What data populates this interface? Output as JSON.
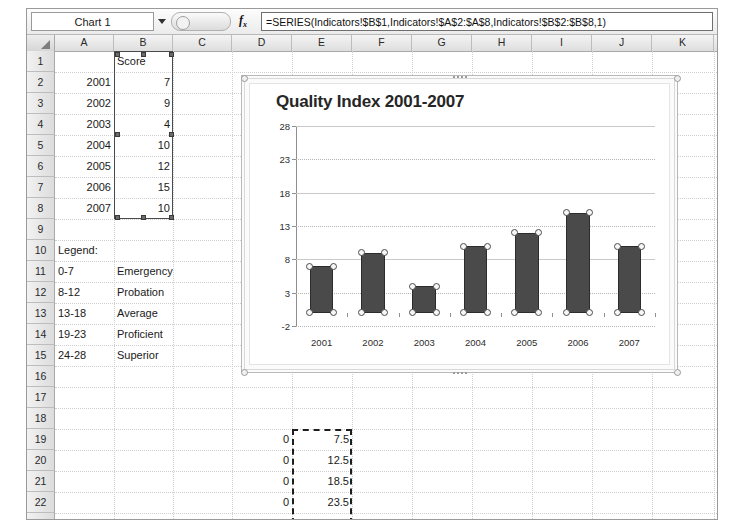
{
  "window": {
    "title": "Microsoft Excel worksheet with chart"
  },
  "formula_bar": {
    "name_box_value": "Chart 1",
    "fx_label": "fx",
    "formula": "=SERIES(Indicators!$B$1,Indicators!$A$2:$A$8,Indicators!$B$2:$B$8,1)"
  },
  "grid": {
    "columns": [
      "A",
      "B",
      "C",
      "D",
      "E",
      "F",
      "G",
      "H",
      "I",
      "J",
      "K"
    ],
    "rows": [
      1,
      2,
      3,
      4,
      5,
      6,
      7,
      8,
      9,
      10,
      11,
      12,
      13,
      14,
      15,
      16,
      17,
      18,
      19,
      20,
      21,
      22,
      23
    ],
    "cells": [
      {
        "row": 1,
        "col": "B",
        "value": "Score",
        "align": "left"
      },
      {
        "row": 2,
        "col": "A",
        "value": "2001",
        "align": "right"
      },
      {
        "row": 2,
        "col": "B",
        "value": "7",
        "align": "right"
      },
      {
        "row": 3,
        "col": "A",
        "value": "2002",
        "align": "right"
      },
      {
        "row": 3,
        "col": "B",
        "value": "9",
        "align": "right"
      },
      {
        "row": 4,
        "col": "A",
        "value": "2003",
        "align": "right"
      },
      {
        "row": 4,
        "col": "B",
        "value": "4",
        "align": "right"
      },
      {
        "row": 5,
        "col": "A",
        "value": "2004",
        "align": "right"
      },
      {
        "row": 5,
        "col": "B",
        "value": "10",
        "align": "right"
      },
      {
        "row": 6,
        "col": "A",
        "value": "2005",
        "align": "right"
      },
      {
        "row": 6,
        "col": "B",
        "value": "12",
        "align": "right"
      },
      {
        "row": 7,
        "col": "A",
        "value": "2006",
        "align": "right"
      },
      {
        "row": 7,
        "col": "B",
        "value": "15",
        "align": "right"
      },
      {
        "row": 8,
        "col": "A",
        "value": "2007",
        "align": "right"
      },
      {
        "row": 8,
        "col": "B",
        "value": "10",
        "align": "right"
      },
      {
        "row": 10,
        "col": "A",
        "value": "Legend:",
        "align": "left"
      },
      {
        "row": 11,
        "col": "A",
        "value": "0-7",
        "align": "left"
      },
      {
        "row": 11,
        "col": "B",
        "value": "Emergency",
        "align": "left"
      },
      {
        "row": 12,
        "col": "A",
        "value": "8-12",
        "align": "left"
      },
      {
        "row": 12,
        "col": "B",
        "value": "Probation",
        "align": "left"
      },
      {
        "row": 13,
        "col": "A",
        "value": "13-18",
        "align": "left"
      },
      {
        "row": 13,
        "col": "B",
        "value": "Average",
        "align": "left"
      },
      {
        "row": 14,
        "col": "A",
        "value": "19-23",
        "align": "left"
      },
      {
        "row": 14,
        "col": "B",
        "value": "Proficient",
        "align": "left"
      },
      {
        "row": 15,
        "col": "A",
        "value": "24-28",
        "align": "left"
      },
      {
        "row": 15,
        "col": "B",
        "value": "Superior",
        "align": "left"
      },
      {
        "row": 19,
        "col": "D",
        "value": "0",
        "align": "right"
      },
      {
        "row": 19,
        "col": "E",
        "value": "7.5",
        "align": "right"
      },
      {
        "row": 20,
        "col": "D",
        "value": "0",
        "align": "right"
      },
      {
        "row": 20,
        "col": "E",
        "value": "12.5",
        "align": "right"
      },
      {
        "row": 21,
        "col": "D",
        "value": "0",
        "align": "right"
      },
      {
        "row": 21,
        "col": "E",
        "value": "18.5",
        "align": "right"
      },
      {
        "row": 22,
        "col": "D",
        "value": "0",
        "align": "right"
      },
      {
        "row": 22,
        "col": "E",
        "value": "23.5",
        "align": "right"
      },
      {
        "row": 23,
        "col": "D",
        "value": "0",
        "align": "right"
      },
      {
        "row": 23,
        "col": "E",
        "value": "28",
        "align": "right"
      }
    ],
    "source_range": {
      "from": "B1",
      "to": "B8",
      "style": "selected-series-range"
    },
    "marching_ants_range": {
      "from": "E19",
      "to": "E23"
    }
  },
  "chart_data": {
    "type": "bar",
    "title": "Quality Index 2001-2007",
    "categories": [
      "2001",
      "2002",
      "2003",
      "2004",
      "2005",
      "2006",
      "2007"
    ],
    "values": [
      7,
      9,
      4,
      10,
      12,
      15,
      10
    ],
    "series": [
      {
        "name": "Score",
        "values": [
          7,
          9,
          4,
          10,
          12,
          15,
          10
        ]
      }
    ],
    "xlabel": "",
    "ylabel": "",
    "ylim": [
      -2,
      28
    ],
    "yticks": [
      28,
      23,
      18,
      13,
      8,
      3,
      -2
    ],
    "grid": true,
    "legend": "none",
    "selected": true,
    "bar_color": "#4a4a4a",
    "accent_color": "#4a4a4a"
  }
}
